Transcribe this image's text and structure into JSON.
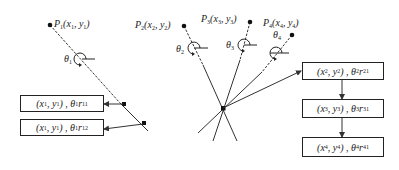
{
  "points": [
    {
      "id": "P1",
      "label": "P",
      "sub": "1",
      "coord": "(x",
      "csub": "1",
      "coord2": ", y",
      "csub2": "1",
      "coord3": ")",
      "theta": "θ",
      "theta_sub": "1"
    },
    {
      "id": "P2",
      "label": "P",
      "sub": "2",
      "coord": "(x",
      "csub": "2",
      "coord2": ", y",
      "csub2": "2",
      "coord3": ")",
      "theta": "θ",
      "theta_sub": "2"
    },
    {
      "id": "P3",
      "label": "P",
      "sub": "3",
      "coord": "(x",
      "csub": "3",
      "coord2": ", y",
      "csub2": "3",
      "coord3": ")",
      "theta": "θ",
      "theta_sub": "3"
    },
    {
      "id": "P4",
      "label": "P",
      "sub": "4",
      "coord": "(x",
      "csub": "4",
      "coord2": ", y",
      "csub2": "4",
      "coord3": ")",
      "theta": "θ",
      "theta_sub": "4"
    }
  ],
  "left_boxes": [
    {
      "a": "(x",
      "as": "1",
      "b": ", y",
      "bs": "1",
      "c": ") , θ",
      "cs": "1",
      "d": "r",
      "ds": "11"
    },
    {
      "a": "(x",
      "as": "1",
      "b": ", y",
      "bs": "1",
      "c": ") , θ",
      "cs": "1",
      "d": "r",
      "ds": "12"
    }
  ],
  "right_boxes": [
    {
      "a": "(x",
      "as": "2",
      "b": ", y",
      "bs": "2",
      "c": ") , θ",
      "cs": "2",
      "d": "r",
      "ds": "21"
    },
    {
      "a": "(x",
      "as": "3",
      "b": ", y",
      "bs": "3",
      "c": ") , θ",
      "cs": "3",
      "d": "r",
      "ds": "31"
    },
    {
      "a": "(x",
      "as": "4",
      "b": ", y",
      "bs": "4",
      "c": ") , θ",
      "cs": "4",
      "d": "r",
      "ds": "41"
    }
  ],
  "colors": {
    "line": "#333333",
    "background": "#ffffff"
  }
}
